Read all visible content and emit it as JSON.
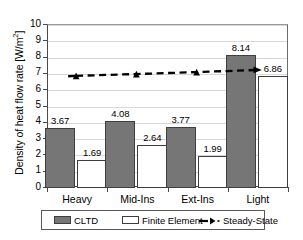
{
  "chart_data": {
    "type": "bar",
    "title": "",
    "xlabel": "",
    "ylabel": "Density of heat flow rate [W/m",
    "ylabel_sup": "2",
    "ylabel_tail": "]",
    "categories": [
      "Heavy",
      "Mid-Ins",
      "Ext-Ins",
      "Light"
    ],
    "ylim": [
      0,
      10
    ],
    "yticks": [
      0,
      1,
      2,
      3,
      4,
      5,
      6,
      7,
      8,
      9,
      10
    ],
    "ytick_labels": [
      "0",
      "1",
      "2",
      "3",
      "4",
      "5",
      "6",
      "7",
      "8",
      "9",
      "10"
    ],
    "grid": true,
    "legend_position": "bottom",
    "series": [
      {
        "name": "CLTD",
        "type": "bar",
        "values": [
          3.67,
          4.08,
          3.77,
          8.14
        ],
        "labels": [
          "3.67",
          "4.08",
          "3.77",
          "8.14"
        ],
        "color": "#767676"
      },
      {
        "name": "Finite Element",
        "type": "bar",
        "values": [
          1.69,
          2.64,
          1.99,
          6.86
        ],
        "labels": [
          "1.69",
          "2.64",
          "1.99",
          "6.86"
        ],
        "color": "#ffffff"
      },
      {
        "name": "Steady-State",
        "type": "line",
        "values": [
          6.82,
          6.93,
          7.05,
          7.18
        ],
        "labels": [
          "",
          "",
          "",
          ""
        ],
        "color": "#000000",
        "linestyle": "dashed",
        "marker": "triangle"
      }
    ]
  },
  "legend": {
    "items": [
      {
        "label": "CLTD",
        "swatch": "filled-gray-square"
      },
      {
        "label": "Finite Element",
        "swatch": "white-square"
      },
      {
        "label": "Steady-State",
        "swatch": "dashed-line-triangle-marker"
      }
    ]
  }
}
